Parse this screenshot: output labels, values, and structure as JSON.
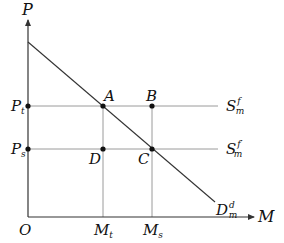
{
  "diagram": {
    "axes": {
      "y_label": "P",
      "x_label": "M",
      "origin_label": "O"
    },
    "price_labels": {
      "p_t": {
        "main": "P",
        "sub": "t"
      },
      "p_s": {
        "main": "P",
        "sub": "s"
      }
    },
    "quantity_labels": {
      "m_t": {
        "main": "M",
        "sub": "t"
      },
      "m_s": {
        "main": "M",
        "sub": "s"
      }
    },
    "points": {
      "a": "A",
      "b": "B",
      "c": "C",
      "d": "D"
    },
    "supply_curves": {
      "s1": {
        "main": "S",
        "sub": "m",
        "sup": "f"
      },
      "s2": {
        "main": "S",
        "sub": "m",
        "sup": "f′"
      }
    },
    "demand_curve": {
      "main": "D",
      "sub": "m",
      "sup": "d"
    }
  }
}
